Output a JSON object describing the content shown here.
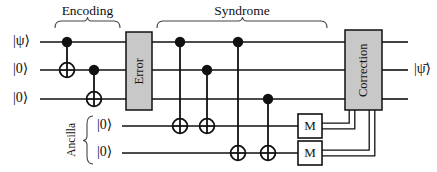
{
  "figure": {
    "type": "quantum-circuit-diagram",
    "width": 437,
    "height": 172,
    "background_color": "#ffffff",
    "ink_color": "#111111",
    "box_fill_color": "#c8c8c8",
    "measure_box_fill_color": "#ffffff"
  },
  "sections": [
    {
      "id": "encoding",
      "label": "Encoding",
      "brace_x_start": 55,
      "brace_x_end": 120,
      "label_x": 87,
      "label_y": 8
    },
    {
      "id": "syndrome",
      "label": "Syndrome",
      "brace_x_start": 157,
      "brace_x_end": 327,
      "label_x": 242,
      "label_y": 8
    }
  ],
  "wires": [
    {
      "id": "q0",
      "input_label": "|ψ⟩",
      "y": 42,
      "type": "quantum"
    },
    {
      "id": "q1",
      "input_label": "|0⟩",
      "y": 70,
      "type": "quantum"
    },
    {
      "id": "q2",
      "input_label": "|0⟩",
      "y": 99,
      "type": "quantum"
    },
    {
      "id": "a0",
      "input_label": "|0⟩",
      "y": 126,
      "type": "quantum"
    },
    {
      "id": "a1",
      "input_label": "|0⟩",
      "y": 153,
      "type": "quantum"
    }
  ],
  "ancilla_group": {
    "label": "Ancilla",
    "label_x": 72,
    "label_y": 140,
    "brace_x": 88,
    "brace_y_top": 116,
    "brace_y_bottom": 164
  },
  "gates": [
    {
      "id": "cnot-enc-1",
      "type": "cnot",
      "x": 67,
      "control_wire": "q0",
      "target_wire": "q1",
      "section": "encoding"
    },
    {
      "id": "cnot-enc-2",
      "type": "cnot",
      "x": 94,
      "control_wire": "q1",
      "target_wire": "q2",
      "section": "encoding"
    },
    {
      "id": "cnot-syn-1",
      "type": "cnot",
      "x": 180,
      "control_wire": "q0",
      "target_wire": "a0",
      "section": "syndrome"
    },
    {
      "id": "cnot-syn-2",
      "type": "cnot",
      "x": 207,
      "control_wire": "q1",
      "target_wire": "a0",
      "section": "syndrome"
    },
    {
      "id": "cnot-syn-3",
      "type": "cnot",
      "x": 238,
      "control_wire": "q0",
      "target_wire": "a1",
      "section": "syndrome"
    },
    {
      "id": "cnot-syn-4",
      "type": "cnot",
      "x": 268,
      "control_wire": "q2",
      "target_wire": "a1",
      "section": "syndrome"
    }
  ],
  "boxes": [
    {
      "id": "error-box",
      "label": "Error",
      "x": 126,
      "y": 32,
      "width": 26,
      "height": 78,
      "fill": "#c8c8c8",
      "text_rotated": true
    },
    {
      "id": "correction-box",
      "label": "Correction",
      "x": 345,
      "y": 30,
      "width": 37,
      "height": 80,
      "fill": "#c8c8c8",
      "text_rotated": true
    }
  ],
  "measurements": [
    {
      "id": "measure-a0",
      "label": "M",
      "x": 298,
      "y": 114,
      "width": 24,
      "height": 24,
      "wire": "a0"
    },
    {
      "id": "measure-a1",
      "label": "M",
      "x": 298,
      "y": 141,
      "width": 24,
      "height": 24,
      "wire": "a1"
    }
  ],
  "classical_wires": [
    {
      "id": "classical-a0",
      "from": "measure-a0",
      "to": "correction-box",
      "path": "M322,126 H352 V110"
    },
    {
      "id": "classical-a1",
      "from": "measure-a1",
      "to": "correction-box",
      "path": "M322,153 H372 V110"
    }
  ],
  "output": {
    "label": "|ψ̄⟩",
    "label_x": 416,
    "label_y": 70,
    "wire_end_x": 408
  },
  "input_label_x": 22,
  "ancilla_input_label_x": 105,
  "wire_start_x": 40,
  "ancilla_wire_start_x": 122
}
